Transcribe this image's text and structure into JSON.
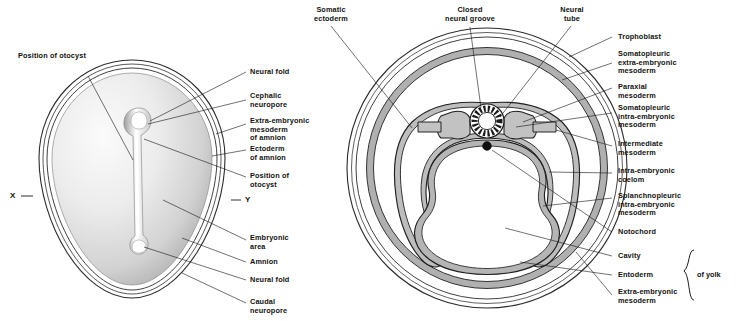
{
  "figure": {
    "markers": {
      "x": "X",
      "y": "Y"
    },
    "bracket_label": "of yolk"
  },
  "left_diagram": {
    "name": "dorsal-view-of-embryo",
    "labels": [
      {
        "id": "position-of-otocyst-top",
        "text": "Position of otocyst",
        "align": "left"
      },
      {
        "id": "neural-fold-top",
        "text": "Neural fold"
      },
      {
        "id": "cephalic-neuropore",
        "text": "Cephalic\nneuropore"
      },
      {
        "id": "extra-embryonic-mesoderm-of-amnion",
        "text": "Extra-embryonic\nmesoderm\nof amnion"
      },
      {
        "id": "ectoderm-of-amnion",
        "text": "Ectoderm\nof amnion"
      },
      {
        "id": "position-of-otocyst",
        "text": "Position of\notocyst"
      },
      {
        "id": "embryonic-area",
        "text": "Embryonic\narea"
      },
      {
        "id": "amnion",
        "text": "Amnion"
      },
      {
        "id": "neural-fold-bottom",
        "text": "Neural fold"
      },
      {
        "id": "caudal-neuropore",
        "text": "Caudal\nneuropore"
      }
    ]
  },
  "right_diagram": {
    "name": "transverse-section-of-embryo",
    "top_labels": [
      {
        "id": "somatic-ectoderm",
        "text": "Somatic\nectoderm"
      },
      {
        "id": "closed-neural-groove",
        "text": "Closed\nneural groove"
      },
      {
        "id": "neural-tube",
        "text": "Neural\ntube"
      }
    ],
    "right_labels": [
      {
        "id": "trophoblast",
        "text": "Trophoblast"
      },
      {
        "id": "somatopleuric-extra-embryonic-mesoderm",
        "text": "Somatopleuric\nextra-embryonic\nmesoderm"
      },
      {
        "id": "paraxial-mesoderm",
        "text": "Paraxial\nmesoderm"
      },
      {
        "id": "somatopleuric-intra-embryonic-mesoderm",
        "text": "Somatopleuric\nintra-embryonic\nmesoderm"
      },
      {
        "id": "intermediate-mesoderm",
        "text": "Intermediate\nmesoderm"
      },
      {
        "id": "intra-embryonic-coelom",
        "text": "Intra-embryonic\ncoelom"
      },
      {
        "id": "splanchnopleuric-intra-embryonic-mesoderm",
        "text": "Splanchnopleuric\nintra-embryonic\nmesoderm"
      },
      {
        "id": "notochord",
        "text": "Notochord"
      },
      {
        "id": "cavity",
        "text": "Cavity"
      },
      {
        "id": "entoderm",
        "text": "Entoderm"
      },
      {
        "id": "extra-embryonic-mesoderm",
        "text": "Extra-embryonic\nmesoderm"
      }
    ]
  },
  "colors": {
    "ink": "#111111",
    "leader": "#1a1a1a",
    "mesoderm_fill": "#b9b9b9",
    "membrane_fill": "#9a9a9a",
    "embryo_light": "#f4f4f4",
    "embryo_mid": "#d6d6d6",
    "embryo_dark": "#b0b0b0",
    "background": "#ffffff"
  }
}
